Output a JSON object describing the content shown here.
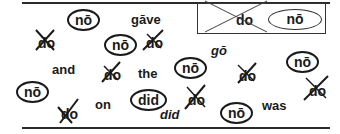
{
  "legend": {
    "crossed_word": "do",
    "circled_word": "nō"
  },
  "items": [
    {
      "type": "circled",
      "text": "nō"
    },
    {
      "type": "word",
      "text": "gāve"
    },
    {
      "type": "crossed",
      "text": "do"
    },
    {
      "type": "circled",
      "text": "nō"
    },
    {
      "type": "crossed",
      "text": "do"
    },
    {
      "type": "word",
      "text": "gō"
    },
    {
      "type": "word",
      "text": "and"
    },
    {
      "type": "crossed",
      "text": "do"
    },
    {
      "type": "word",
      "text": "the"
    },
    {
      "type": "circled",
      "text": "nō"
    },
    {
      "type": "crossed",
      "text": "do"
    },
    {
      "type": "circled",
      "text": "nō"
    },
    {
      "type": "circled",
      "text": "nō"
    },
    {
      "type": "crossed",
      "text": "do"
    },
    {
      "type": "word",
      "text": "on"
    },
    {
      "type": "word",
      "text": "did"
    },
    {
      "type": "crossed",
      "text": "do"
    },
    {
      "type": "circled",
      "text": "nō"
    },
    {
      "type": "word",
      "text": "was"
    },
    {
      "type": "crossed",
      "text": "do"
    }
  ],
  "colors": {
    "ink": "#1a1a1a",
    "background": "#ffffff"
  }
}
